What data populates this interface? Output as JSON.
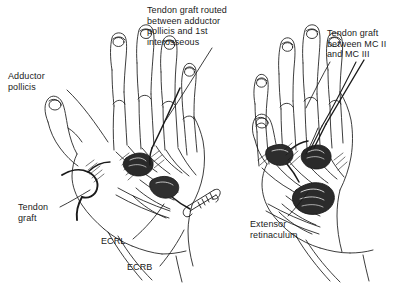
{
  "figure": {
    "background_color": "#ffffff",
    "ink_color": "#1a1a1a",
    "width": 420,
    "height": 286
  },
  "labels": {
    "adductor_pollicis": "Adductor\npollicis",
    "tendon_graft_routed": "Tendon graft routed\nbetween adductor\npollicis and 1st\ninterosseous",
    "tendon_graft_mc": "Tendon graft\nbetween MC II\nand MC III",
    "tendon_graft": "Tendon\ngraft",
    "ecrl": "ECRL",
    "ecrb": "ECRB",
    "extensor_retinaculum": "Extensor\nretinaculum"
  },
  "panels": {
    "left_hand": "left hand dorsum with tendon graft through first web space",
    "right_hand": "right hand dorsum with tendon graft between second and third metacarpals"
  }
}
